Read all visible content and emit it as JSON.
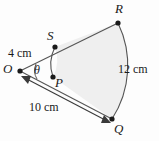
{
  "figure": {
    "type": "geometry-diagram",
    "background_color": "#fdfdfd",
    "shading_color": "#eeeeee",
    "stroke_color": "#4a4a4a",
    "text_color": "#1a1a1a",
    "points": [
      {
        "name": "R",
        "label": "R",
        "x": 118,
        "y": 23
      },
      {
        "name": "S",
        "label": "S",
        "x": 55,
        "y": 47
      },
      {
        "name": "P",
        "label": "P",
        "x": 53,
        "y": 77
      },
      {
        "name": "Q",
        "label": "Q",
        "x": 112,
        "y": 119
      },
      {
        "name": "O",
        "label": "O",
        "x": 20,
        "y": 71
      }
    ],
    "measurements": [
      {
        "name": "inner-radius",
        "label": "4 cm",
        "segment": "OS"
      },
      {
        "name": "outer-radius",
        "label": "10 cm",
        "segment": "OQ"
      },
      {
        "name": "outer-arc-length",
        "label": "12 cm",
        "segment": "arc RQ"
      }
    ],
    "angle": {
      "name": "central-angle",
      "label": "θ",
      "vertex": "O"
    }
  }
}
